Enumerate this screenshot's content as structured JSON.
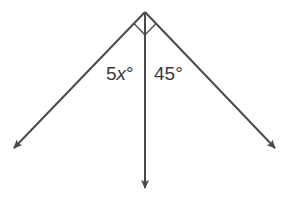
{
  "diagram": {
    "type": "angle-rays",
    "line_color": "#4a4a4a",
    "vertex": {
      "x": 145,
      "y": 12
    },
    "rays": [
      {
        "name": "left-ray",
        "end": {
          "x": 12,
          "y": 150
        }
      },
      {
        "name": "middle-ray",
        "end": {
          "x": 145,
          "y": 190
        }
      },
      {
        "name": "right-ray",
        "end": {
          "x": 277,
          "y": 150
        }
      }
    ],
    "right_angle_markers": 2,
    "labels": {
      "left_angle": {
        "coef": "5",
        "var": "x",
        "deg": "°"
      },
      "right_angle": {
        "value": "45",
        "deg": "°"
      }
    }
  }
}
